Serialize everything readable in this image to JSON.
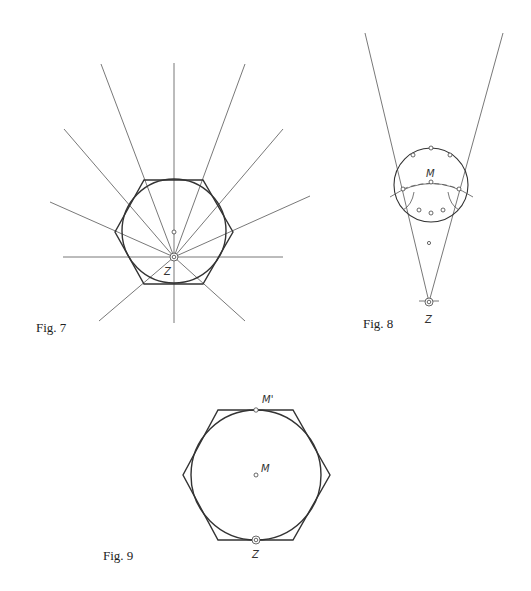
{
  "figures": [
    {
      "id": "fig7",
      "caption": "Fig. 7",
      "labels": {
        "z": "Z"
      },
      "description": "Hexagon with inscribed circle; rays fan out from point Z on the lower part, with a horizontal line through Z"
    },
    {
      "id": "fig8",
      "caption": "Fig. 8",
      "labels": {
        "m": "M",
        "z": "Z"
      },
      "description": "Two lines diverging from Z upward; circle with marked points and arc through M"
    },
    {
      "id": "fig9",
      "caption": "Fig. 9",
      "labels": {
        "m_prime": "M'",
        "m": "M",
        "z": "Z"
      },
      "description": "Hexagon with inscribed circle; M' at top, M at center, Z at bottom"
    }
  ],
  "colors": {
    "line": "#555555",
    "background": "#ffffff"
  }
}
